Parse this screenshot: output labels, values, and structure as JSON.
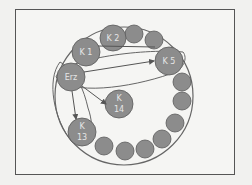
{
  "diagram": {
    "colors": {
      "node_fill": "#8c8c8c",
      "node_stroke": "#5a5a5a",
      "line": "#555555",
      "label": "#e6e6e6",
      "background": "#f5f5f3"
    },
    "nodes": [
      {
        "id": "erz",
        "label": "Erz"
      },
      {
        "id": "k1",
        "label": "K 1"
      },
      {
        "id": "k2",
        "label": "K 2"
      },
      {
        "id": "k5",
        "label": "K 5"
      },
      {
        "id": "k14a",
        "label": "K"
      },
      {
        "id": "k14b",
        "label": "14"
      },
      {
        "id": "k13a",
        "label": "K"
      },
      {
        "id": "k13b",
        "label": "13"
      }
    ],
    "edges": [
      {
        "from": "Erz",
        "to": "K 5"
      },
      {
        "from": "Erz",
        "to": "K 14"
      },
      {
        "from": "Erz",
        "to": "K 13"
      },
      {
        "from": "K 1",
        "to": "K 5"
      }
    ],
    "unlabeled_nodes": 11
  }
}
